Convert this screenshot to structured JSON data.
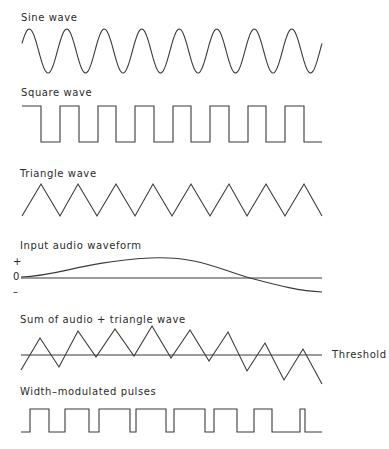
{
  "panels": [
    {
      "id": "sine",
      "title": "Sine wave"
    },
    {
      "id": "square",
      "title": "Square wave"
    },
    {
      "id": "triangle",
      "title": "Triangle wave"
    },
    {
      "id": "audio",
      "title": "Input audio waveform",
      "axis_labels": {
        "plus": "+",
        "zero": "0",
        "minus": "–"
      }
    },
    {
      "id": "sum",
      "title": "Sum of audio + triangle wave",
      "threshold_label": "Threshold"
    },
    {
      "id": "pwm",
      "title": "Width–modulated pulses"
    }
  ],
  "colors": {
    "stroke": "#3a3a3a",
    "text": "#2a2a2a",
    "background": "#ffffff"
  },
  "geometry": {
    "sine": {
      "x_start": 22,
      "x_end": 322,
      "center_y": 51,
      "amplitude": 22,
      "cycles": 8
    },
    "square": {
      "points": "22,106 41,106 41,142 60,142 60,106 79,106 79,142 98,142 98,106 116,106 116,142 135,142 135,106 154,106 154,142 173,142 173,106 191,106 191,142 210,142 210,106 229,106 229,142 248,142 248,106 266,106 266,142 285,142 285,106 304,106 304,142 322,142"
    },
    "triangle": {
      "points": "22,216 41,184 60,216 78,184 97,216 116,184 135,216 153,184 172,216 191,184 210,216 229,184 247,216 266,184 285,216 304,184 322,216"
    },
    "audio": {
      "zero_y": 278,
      "x_start": 21,
      "x_end": 322,
      "curve": "M21,277 C60,276 80,262 150,258 C200,256 220,270 250,278 C280,286 300,291 322,292"
    },
    "sum": {
      "threshold_y": 355,
      "points": "21,370 40,338 59,367 78,331 96,357 115,329 134,356 152,326 171,358 190,330 209,361 228,332 247,371 265,343 284,380 303,349 322,384"
    },
    "pwm": {
      "points": "21,432 30,432 30,409 49,409 49,432 65,432 65,409 89,409 89,432 99,432 99,409 130,409 130,432 136,432 136,409 166,409 166,432 174,432 174,409 205,409 205,432 214,432 214,409 237,409 237,432 254,432 254,409 272,409 272,432 300,432 300,409 305,409 305,432 322,432"
    }
  }
}
